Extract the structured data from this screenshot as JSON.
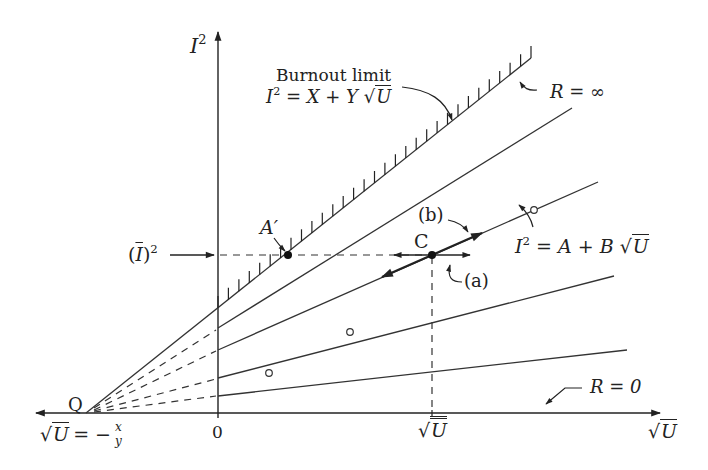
{
  "diagram": {
    "type": "current-squared vs root-velocity characteristic diagram",
    "axes": {
      "y_label": "I",
      "y_label_sup": "2",
      "x_label": "U",
      "origin_label": "0",
      "x_marker_label": "U",
      "neg_intercept_lhs": "U",
      "neg_intercept_eq": "= −",
      "neg_intercept_num": "x",
      "neg_intercept_den": "y"
    },
    "labels": {
      "burnout_title": "Burnout limit",
      "burnout_eq_lhs": "I",
      "burnout_eq_sup": "2",
      "burnout_eq_rhs": " = X + Y",
      "burnout_eq_root": "U",
      "r_infinity": "R = ∞",
      "r_zero": "R = 0",
      "line_eq_lhs": "I",
      "line_eq_sup": "2",
      "line_eq_rhs": " = A + B",
      "line_eq_root": "U",
      "point_a_prime": "A′",
      "point_c": "C",
      "point_q": "Q",
      "label_a": "(a)",
      "label_b": "(b)",
      "i_bar_sq": "I",
      "i_bar_sup": "2"
    },
    "lines": [
      {
        "name": "burnout-limit",
        "from": [
          86,
          413
        ],
        "to": [
          531,
          58
        ],
        "hatched": true
      },
      {
        "name": "line-2",
        "from": [
          218,
          328
        ],
        "to": [
          572,
          108
        ]
      },
      {
        "name": "line-A-B",
        "from": [
          218,
          350
        ],
        "to": [
          598,
          182
        ]
      },
      {
        "name": "line-4",
        "from": [
          218,
          378
        ],
        "to": [
          614,
          276
        ]
      },
      {
        "name": "line-5-R0-side",
        "from": [
          218,
          396
        ],
        "to": [
          627,
          350
        ]
      }
    ],
    "points": {
      "Q": [
        86,
        413
      ],
      "A_prime": [
        288,
        255
      ],
      "C": [
        432,
        255
      ],
      "open_circles": [
        [
          269,
          373
        ],
        [
          350,
          332
        ],
        [
          534,
          210
        ]
      ]
    },
    "colors": {
      "ink": "#222222",
      "background": "#ffffff"
    }
  }
}
